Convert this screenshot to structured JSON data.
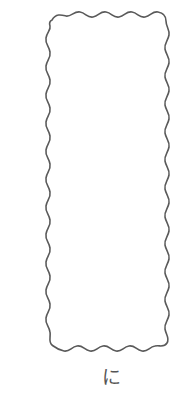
{
  "figure": {
    "shape": "wavy-rounded-rectangle",
    "stroke_color": "#5a5a5a",
    "fill_color": "#ffffff"
  },
  "caption": {
    "text": "に"
  }
}
